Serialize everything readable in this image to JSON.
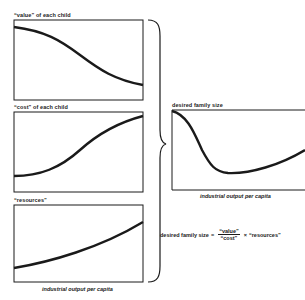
{
  "panels": [
    {
      "id": "value",
      "label": "“value” of each child",
      "curve": "decreasing-sigmoid"
    },
    {
      "id": "cost",
      "label": "“cost” of each child",
      "curve": "increasing-sigmoid"
    },
    {
      "id": "resources",
      "label": "“resources”",
      "curve": "increasing-convex"
    }
  ],
  "left_xlabel": "industrial output per capita",
  "result": {
    "label": "desired family size",
    "xlabel": "industrial output per capita",
    "curve": "drop-then-rise"
  },
  "formula": {
    "lhs": "desired family size",
    "equals": "=",
    "numerator": "“value”",
    "denominator": "“cost”",
    "times": "×",
    "factor": "“resources”"
  },
  "colors": {
    "ink": "#1a1a1a",
    "background": "#ffffff"
  }
}
